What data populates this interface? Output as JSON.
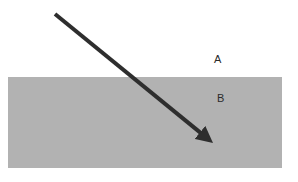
{
  "figure": {
    "background_color": "#ffffff",
    "width": 298,
    "height": 182
  },
  "regions": [
    {
      "id": "region-a",
      "label": "A",
      "description": "upper region above boundary",
      "fill": "#ffffff",
      "label_x": 214,
      "label_y": 54
    },
    {
      "id": "region-b",
      "label": "B",
      "description": "lower shaded rectangular medium",
      "fill": "#b2b2b2",
      "label_x": 217,
      "label_y": 93,
      "rect": {
        "x": 8,
        "y": 77,
        "width": 274,
        "height": 91
      }
    }
  ],
  "ray": {
    "name": "incident-ray",
    "color": "#2e2e2e",
    "stroke_width": 4,
    "start_x": 55,
    "start_y": 14,
    "end_x": 213,
    "end_y": 143,
    "arrowhead": "solid-triangle",
    "boundary_crossing_x": 133,
    "boundary_crossing_y": 77
  },
  "chart_data": {
    "type": "diagram",
    "annotations": [
      "A",
      "B"
    ]
  }
}
